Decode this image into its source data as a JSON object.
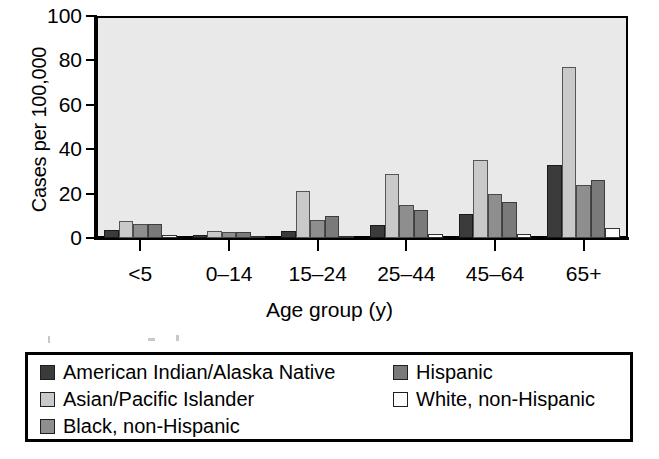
{
  "chart_data": {
    "type": "bar",
    "title": "",
    "xlabel": "Age group (y)",
    "ylabel": "Cases per 100,000",
    "ylim": [
      0,
      100
    ],
    "yticks": [
      0,
      20,
      40,
      60,
      80,
      100
    ],
    "grid": false,
    "legend_position": "bottom",
    "categories": [
      "<5",
      "0–14",
      "15–24",
      "25–44",
      "45–64",
      "65+"
    ],
    "series": [
      {
        "name": "American Indian/Alaska Native",
        "color": "#3b3b3b",
        "values": [
          3.5,
          1.2,
          3.0,
          6.0,
          11.0,
          33.0
        ]
      },
      {
        "name": "Asian/Pacific Islander",
        "color": "#c9c9c9",
        "values": [
          7.5,
          3.0,
          21.0,
          29.0,
          35.0,
          77.0
        ]
      },
      {
        "name": "Black, non-Hispanic",
        "color": "#8e8e8e",
        "values": [
          6.2,
          2.7,
          8.0,
          15.0,
          20.0,
          24.0
        ]
      },
      {
        "name": "Hispanic",
        "color": "#7a7a7a",
        "values": [
          6.3,
          2.5,
          10.0,
          12.5,
          16.0,
          26.0
        ]
      },
      {
        "name": "White, non-Hispanic",
        "color": "#fdfdfd",
        "values": [
          1.3,
          0.4,
          0.6,
          1.8,
          2.0,
          4.5
        ]
      }
    ]
  },
  "legend": {
    "entries": [
      {
        "label": "American Indian/Alaska Native"
      },
      {
        "label": "Asian/Pacific Islander"
      },
      {
        "label": "Black, non-Hispanic"
      },
      {
        "label": "Hispanic"
      },
      {
        "label": "White, non-Hispanic"
      }
    ]
  }
}
